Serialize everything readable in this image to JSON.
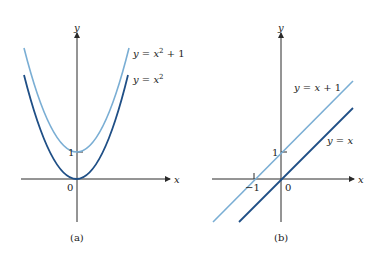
{
  "colors": {
    "axis": "#2a2a2a",
    "curve_dark": "#1f4f86",
    "curve_light": "#7aaed4",
    "text": "#222222"
  },
  "panels": [
    {
      "caption": "(a)",
      "axis_x_label": "x",
      "axis_y_label": "y",
      "origin_label": "0",
      "tick_y_label": "1",
      "curves": [
        {
          "label": "y = x² + 1",
          "label_main": "y = x",
          "label_sup": "2",
          "label_tail": " + 1",
          "expr": "x^2+1"
        },
        {
          "label": "y = x²",
          "label_main": "y = x",
          "label_sup": "2",
          "label_tail": "",
          "expr": "x^2"
        }
      ]
    },
    {
      "caption": "(b)",
      "axis_x_label": "x",
      "axis_y_label": "y",
      "origin_label": "0",
      "tick_y_label": "1",
      "tick_x_label": "−1",
      "curves": [
        {
          "label": "y = x + 1",
          "expr": "x+1"
        },
        {
          "label": "y = x",
          "expr": "x"
        }
      ]
    }
  ]
}
